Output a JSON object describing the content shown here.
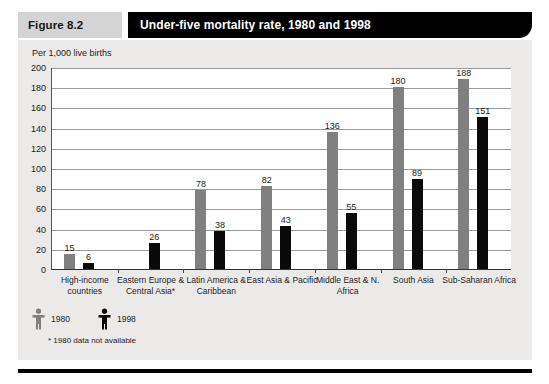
{
  "header": {
    "figure_tag": "Figure 8.2",
    "title": "Under-five mortality rate, 1980 and 1998"
  },
  "subtitle": "Per 1,000 live births",
  "legend": {
    "items": [
      {
        "label": "1980",
        "icon": "person-icon",
        "color": "#808080"
      },
      {
        "label": "1998",
        "icon": "person-icon",
        "color": "#0a0a0a"
      }
    ]
  },
  "footnote": "* 1980 data not available",
  "chart_data": {
    "type": "bar",
    "title": "Under-five mortality rate, 1980 and 1998",
    "xlabel": "",
    "ylabel": "Per 1,000 live births",
    "ylim": [
      0,
      200
    ],
    "yticks": [
      0,
      20,
      40,
      60,
      80,
      100,
      120,
      140,
      160,
      180,
      200
    ],
    "grid": true,
    "legend_position": "below-plot-left",
    "categories": [
      "High-income countries",
      "Eastern Europe & Central Asia*",
      "Latin America & Caribbean",
      "East Asia & Pacific",
      "Middle East & N. Africa",
      "South Asia",
      "Sub-Saharan Africa"
    ],
    "series": [
      {
        "name": "1980",
        "color": "#808080",
        "values": [
          15,
          null,
          78,
          82,
          136,
          180,
          188
        ]
      },
      {
        "name": "1998",
        "color": "#0a0a0a",
        "values": [
          6,
          26,
          38,
          43,
          55,
          89,
          151
        ]
      }
    ],
    "annotations": [
      "* 1980 data not available"
    ]
  }
}
